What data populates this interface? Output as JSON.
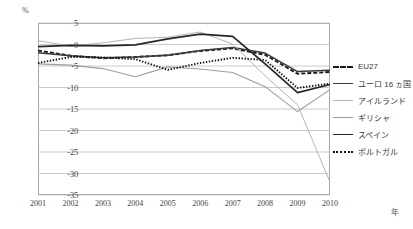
{
  "chart_data": {
    "type": "line",
    "title": "",
    "xlabel": "年",
    "ylabel": "%",
    "x": [
      2001,
      2002,
      2003,
      2004,
      2005,
      2006,
      2007,
      2008,
      2009,
      2010
    ],
    "xlim": [
      2001,
      2010
    ],
    "ylim": [
      -35,
      5
    ],
    "yticks": [
      5,
      0,
      -5,
      -10,
      -15,
      -20,
      -25,
      -30,
      -35
    ],
    "ytick_labels": [
      "5",
      "0",
      "-5",
      "-10",
      "-15",
      "-20",
      "-25",
      "-30",
      "-35"
    ],
    "xtick_labels": [
      "2001",
      "2002",
      "2003",
      "2004",
      "2005",
      "2006",
      "2007",
      "2008",
      "2009",
      "2010"
    ],
    "grid": true,
    "legend_position": "right",
    "series": [
      {
        "name": "EU27",
        "style": "dashed",
        "color": "#1a1a1a",
        "values": [
          -1.4,
          -2.6,
          -3.2,
          -2.9,
          -2.5,
          -1.5,
          -0.9,
          -2.4,
          -6.8,
          -6.4
        ]
      },
      {
        "name": "ユーロ16ヵ国",
        "style": "solid",
        "color": "#3a3a3a",
        "values": [
          -1.9,
          -2.6,
          -3.1,
          -2.9,
          -2.5,
          -1.4,
          -0.7,
          -2.0,
          -6.3,
          -6.0
        ]
      },
      {
        "name": "アイルランド",
        "style": "solid-light",
        "color": "#b0b0b0",
        "values": [
          0.9,
          -0.4,
          0.4,
          1.4,
          1.7,
          2.9,
          0.1,
          -7.3,
          -14.0,
          -32.0
        ]
      },
      {
        "name": "ギリシャ",
        "style": "solid-light2",
        "color": "#9a9a9a",
        "values": [
          -4.5,
          -4.8,
          -5.6,
          -7.5,
          -5.2,
          -5.7,
          -6.5,
          -9.8,
          -15.6,
          -10.5
        ]
      },
      {
        "name": "スペイン",
        "style": "solid-dark",
        "color": "#262626",
        "values": [
          -0.5,
          -0.2,
          -0.3,
          -0.1,
          1.3,
          2.4,
          1.9,
          -4.5,
          -11.2,
          -9.3
        ]
      },
      {
        "name": "ポルトガル",
        "style": "dotted",
        "color": "#111111",
        "values": [
          -4.3,
          -2.9,
          -3.0,
          -3.4,
          -5.9,
          -4.3,
          -3.1,
          -3.6,
          -10.1,
          -9.1
        ]
      }
    ]
  },
  "legend": {
    "items": [
      {
        "label": "EU27"
      },
      {
        "label": "ユーロ 16 ヵ国"
      },
      {
        "label": "アイルランド"
      },
      {
        "label": "ギリシャ"
      },
      {
        "label": "スペイン"
      },
      {
        "label": "ポルトガル"
      }
    ]
  },
  "axes": {
    "y_unit": "%",
    "x_unit": "年"
  }
}
